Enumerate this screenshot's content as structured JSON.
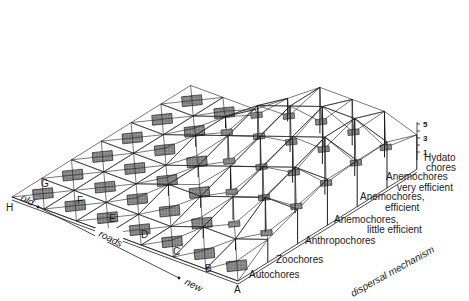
{
  "figure": {
    "type": "3d-surface-diagram",
    "road_axis": {
      "label": "roads",
      "old_label": "old",
      "new_label": "new",
      "categories": [
        "H",
        "G",
        "F",
        "E",
        "D",
        "C",
        "B",
        "A"
      ]
    },
    "dispersal_axis": {
      "label": "dispersal mechanism",
      "categories": [
        {
          "line1": "Autochores",
          "line2": ""
        },
        {
          "line1": "Zoochores",
          "line2": ""
        },
        {
          "line1": "Anthropochores",
          "line2": ""
        },
        {
          "line1": "Anemochores,",
          "line2": "little efficient"
        },
        {
          "line1": "Anemochores,",
          "line2": "efficient"
        },
        {
          "line1": "Anemochores",
          "line2": "very efficient"
        },
        {
          "line1": "Hydato",
          "line2": "chores"
        }
      ]
    },
    "vertical_axis": {
      "ticks": [
        "5",
        "3",
        "1"
      ]
    }
  },
  "heights": [
    [
      0,
      0,
      0,
      0,
      0,
      0,
      0
    ],
    [
      0,
      0,
      0,
      0,
      0,
      0,
      0
    ],
    [
      0,
      0,
      0,
      0,
      1,
      1,
      0
    ],
    [
      0,
      0,
      1,
      1,
      2,
      3,
      2
    ],
    [
      0,
      0,
      1,
      2,
      3,
      4,
      4
    ],
    [
      0,
      1,
      2,
      3,
      4,
      5,
      4
    ],
    [
      0,
      1,
      3,
      4,
      5,
      5,
      4
    ],
    [
      0,
      2,
      3,
      4,
      4,
      4,
      3
    ]
  ],
  "colors": {
    "line": "#1c1c1c",
    "fill": "#7a7a7a",
    "background": "#ffffff"
  }
}
